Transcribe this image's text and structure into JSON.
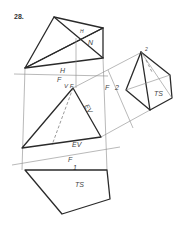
{
  "figure": {
    "number": "28.",
    "labels": {
      "top_view_N": "N",
      "top_view_H_small": "H",
      "folding_H": "H",
      "folding_F": "F",
      "front_vf": "V F",
      "front_EV_side": "EV",
      "aux_F": "F",
      "aux_2": "2",
      "aux_TS": "TS",
      "aux_apex_2": "2",
      "edge_EV": "EV",
      "fold2_F": "F",
      "fold2_1": "1",
      "bottom_TS": "TS"
    }
  }
}
